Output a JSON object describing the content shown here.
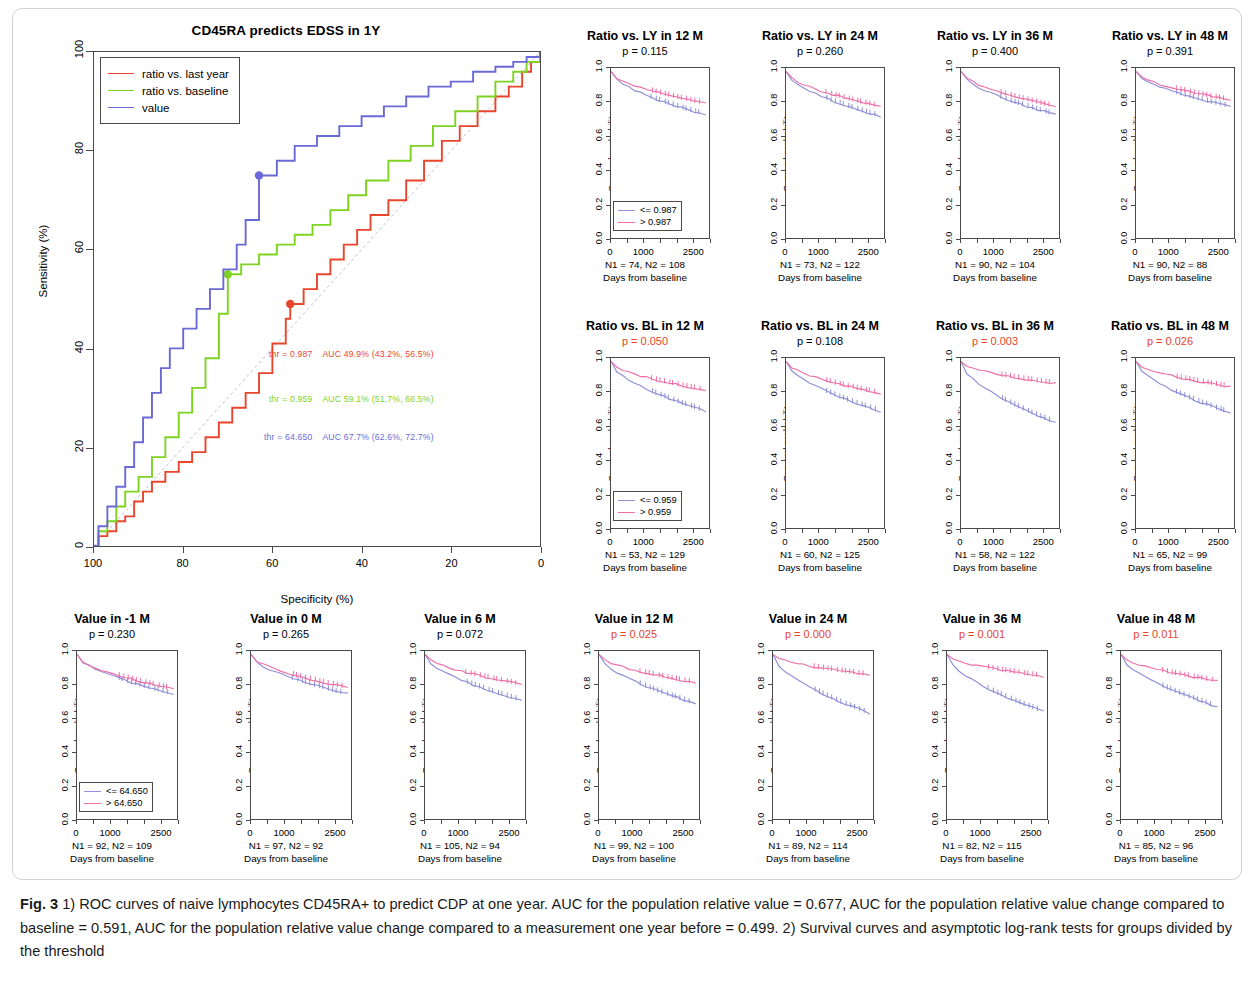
{
  "colors": {
    "red": "#e8452c",
    "green": "#7ed321",
    "blue": "#6a6ad6",
    "pink": "#ee6fa8",
    "purple": "#8f8fd8",
    "axis": "#4a4a4a",
    "sig_red": "#e8452c",
    "black": "#000000"
  },
  "roc": {
    "title": "CD45RA predicts EDSS in 1Y",
    "xlabel": "Specificity (%)",
    "ylabel": "Sensitivity (%)",
    "xticks": [
      "100",
      "80",
      "60",
      "40",
      "20",
      "0"
    ],
    "yticks": [
      "0",
      "20",
      "40",
      "60",
      "80",
      "100"
    ],
    "legend": [
      {
        "label": "ratio vs. last year",
        "color": "#e8452c"
      },
      {
        "label": "ratio vs. baseline",
        "color": "#7ed321"
      },
      {
        "label": "value",
        "color": "#6a6ad6"
      }
    ],
    "annotations": [
      {
        "threshold": "thr = 0.987",
        "auc": "AUC 49.9% (43.2%, 56.5%)",
        "color": "#e8452c"
      },
      {
        "threshold": "thr = 0.959",
        "auc": "AUC 59.1% (51.7%, 66.5%)",
        "color": "#7ed321"
      },
      {
        "threshold": "thr = 64.650",
        "auc": "AUC 67.7% (62.6%, 72.7%)",
        "color": "#6a6ad6"
      }
    ]
  },
  "chart_data": {
    "type": "line",
    "title": "CD45RA predicts EDSS in 1Y",
    "xlabel": "Specificity (%)",
    "ylabel": "Sensitivity (%)",
    "xlim": [
      100,
      0
    ],
    "ylim": [
      0,
      100
    ],
    "grid": false,
    "legend_position": "top-left",
    "reference_line": "diagonal chance line from (100,0) to (0,100)",
    "series": [
      {
        "name": "ratio vs. last year",
        "color": "#e8452c",
        "auc_percent": 49.9,
        "auc_ci": [
          43.2,
          56.5
        ],
        "threshold": 0.987,
        "operating_point": {
          "specificity": 56,
          "sensitivity": 49
        },
        "points": [
          [
            100,
            0
          ],
          [
            99,
            2
          ],
          [
            97,
            3
          ],
          [
            95,
            5
          ],
          [
            93,
            6
          ],
          [
            91,
            9
          ],
          [
            89,
            11
          ],
          [
            87,
            13
          ],
          [
            84,
            15
          ],
          [
            81,
            17
          ],
          [
            78,
            19
          ],
          [
            75,
            22
          ],
          [
            72,
            25
          ],
          [
            69,
            28
          ],
          [
            66,
            31
          ],
          [
            63,
            35
          ],
          [
            60,
            41
          ],
          [
            57,
            46
          ],
          [
            56,
            49
          ],
          [
            53,
            52
          ],
          [
            50,
            55
          ],
          [
            47,
            58
          ],
          [
            44,
            61
          ],
          [
            41,
            64
          ],
          [
            38,
            67
          ],
          [
            34,
            70
          ],
          [
            30,
            74
          ],
          [
            26,
            78
          ],
          [
            22,
            82
          ],
          [
            18,
            85
          ],
          [
            14,
            88
          ],
          [
            10,
            91
          ],
          [
            7,
            93
          ],
          [
            4,
            96
          ],
          [
            2,
            98
          ],
          [
            0,
            100
          ]
        ]
      },
      {
        "name": "ratio vs. baseline",
        "color": "#7ed321",
        "auc_percent": 59.1,
        "auc_ci": [
          51.7,
          66.5
        ],
        "threshold": 0.959,
        "operating_point": {
          "specificity": 70,
          "sensitivity": 55
        },
        "points": [
          [
            100,
            0
          ],
          [
            99,
            3
          ],
          [
            97,
            5
          ],
          [
            95,
            8
          ],
          [
            93,
            11
          ],
          [
            90,
            14
          ],
          [
            87,
            18
          ],
          [
            84,
            22
          ],
          [
            81,
            27
          ],
          [
            78,
            32
          ],
          [
            75,
            38
          ],
          [
            72,
            47
          ],
          [
            70,
            55
          ],
          [
            67,
            57
          ],
          [
            63,
            59
          ],
          [
            59,
            61
          ],
          [
            55,
            63
          ],
          [
            51,
            65
          ],
          [
            47,
            68
          ],
          [
            43,
            71
          ],
          [
            39,
            74
          ],
          [
            34,
            78
          ],
          [
            29,
            81
          ],
          [
            24,
            85
          ],
          [
            19,
            88
          ],
          [
            14,
            91
          ],
          [
            10,
            94
          ],
          [
            6,
            96
          ],
          [
            3,
            98
          ],
          [
            0,
            100
          ]
        ]
      },
      {
        "name": "value",
        "color": "#6a6ad6",
        "auc_percent": 67.7,
        "auc_ci": [
          62.6,
          72.7
        ],
        "threshold": 64.65,
        "operating_point": {
          "specificity": 63,
          "sensitivity": 75
        },
        "points": [
          [
            100,
            0
          ],
          [
            99,
            4
          ],
          [
            97,
            8
          ],
          [
            95,
            12
          ],
          [
            93,
            16
          ],
          [
            91,
            21
          ],
          [
            89,
            26
          ],
          [
            87,
            31
          ],
          [
            85,
            36
          ],
          [
            83,
            40
          ],
          [
            80,
            44
          ],
          [
            77,
            48
          ],
          [
            74,
            52
          ],
          [
            71,
            56
          ],
          [
            68,
            61
          ],
          [
            66,
            66
          ],
          [
            63,
            75
          ],
          [
            59,
            78
          ],
          [
            55,
            81
          ],
          [
            50,
            83
          ],
          [
            45,
            85
          ],
          [
            40,
            87
          ],
          [
            35,
            89
          ],
          [
            30,
            91
          ],
          [
            25,
            93
          ],
          [
            20,
            94
          ],
          [
            15,
            96
          ],
          [
            10,
            97
          ],
          [
            6,
            98
          ],
          [
            3,
            99
          ],
          [
            0,
            100
          ]
        ]
      }
    ]
  },
  "km_common": {
    "ylabel": "Survival probability",
    "xlabel": "Days from baseline",
    "yticks": [
      "0.0",
      "0.2",
      "0.4",
      "0.6",
      "0.8",
      "1.0"
    ],
    "xticks": [
      "0",
      "1000",
      "2500"
    ]
  },
  "km_panels": [
    {
      "title": "Ratio vs. LY in 12 M",
      "p": "p = 0.115",
      "p_significant": false,
      "n_text": "N1 = 74, N2 = 108",
      "n1": 74,
      "n2": 108,
      "legend": [
        {
          "label": "<= 0.987",
          "color": "#8f8fd8"
        },
        {
          "label": "> 0.987",
          "color": "#ee6fa8"
        }
      ],
      "low_end": 0.74,
      "high_end": 0.81
    },
    {
      "title": "Ratio vs. LY in 24 M",
      "p": "p = 0.260",
      "p_significant": false,
      "n_text": "N1 = 73, N2 = 122",
      "n1": 73,
      "n2": 122,
      "legend": null,
      "low_end": 0.73,
      "high_end": 0.79
    },
    {
      "title": "Ratio vs. LY in 36 M",
      "p": "p = 0.400",
      "p_significant": false,
      "n_text": "N1 = 90, N2 = 104",
      "n1": 90,
      "n2": 104,
      "legend": null,
      "low_end": 0.74,
      "high_end": 0.79
    },
    {
      "title": "Ratio vs. LY in 48 M",
      "p": "p = 0.391",
      "p_significant": false,
      "n_text": "N1 = 90, N2 = 88",
      "n1": 90,
      "n2": 88,
      "legend": null,
      "low_end": 0.79,
      "high_end": 0.83
    },
    {
      "title": "Ratio vs. BL in 12 M",
      "p": "p = 0.050",
      "p_significant": true,
      "n_text": "N1 = 53, N2 = 129",
      "n1": 53,
      "n2": 129,
      "legend": [
        {
          "label": "<= 0.959",
          "color": "#8f8fd8"
        },
        {
          "label": "> 0.959",
          "color": "#ee6fa8"
        }
      ],
      "low_end": 0.7,
      "high_end": 0.83
    },
    {
      "title": "Ratio vs. BL in 24 M",
      "p": "p = 0.108",
      "p_significant": false,
      "n_text": "N1 = 60, N2 = 125",
      "n1": 60,
      "n2": 125,
      "legend": null,
      "low_end": 0.7,
      "high_end": 0.81
    },
    {
      "title": "Ratio vs. BL in 36 M",
      "p": "p = 0.003",
      "p_significant": true,
      "n_text": "N1 = 58, N2 = 122",
      "n1": 58,
      "n2": 122,
      "legend": null,
      "low_end": 0.63,
      "high_end": 0.87
    },
    {
      "title": "Ratio vs. BL in 48 M",
      "p": "p = 0.026",
      "p_significant": true,
      "n_text": "N1 = 65, N2 = 99",
      "n1": 65,
      "n2": 99,
      "legend": null,
      "low_end": 0.69,
      "high_end": 0.85
    },
    {
      "title": "Value in -1 M",
      "p": "p = 0.230",
      "p_significant": false,
      "n_text": "N1 = 92, N2 = 109",
      "n1": 92,
      "n2": 109,
      "legend": [
        {
          "label": "<= 64.650",
          "color": "#8f8fd8"
        },
        {
          "label": "> 64.650",
          "color": "#ee6fa8"
        }
      ],
      "low_end": 0.76,
      "high_end": 0.79
    },
    {
      "title": "Value in 0 M",
      "p": "p = 0.265",
      "p_significant": false,
      "n_text": "N1 = 97, N2 = 92",
      "n1": 97,
      "n2": 92,
      "legend": null,
      "low_end": 0.76,
      "high_end": 0.8
    },
    {
      "title": "Value in 6 M",
      "p": "p = 0.072",
      "p_significant": false,
      "n_text": "N1 = 105, N2 = 94",
      "n1": 105,
      "n2": 94,
      "legend": null,
      "low_end": 0.72,
      "high_end": 0.82
    },
    {
      "title": "Value in 12 M",
      "p": "p = 0.025",
      "p_significant": true,
      "n_text": "N1 = 99, N2 = 100",
      "n1": 99,
      "n2": 100,
      "legend": null,
      "low_end": 0.7,
      "high_end": 0.83
    },
    {
      "title": "Value in 24 M",
      "p": "p = 0.000",
      "p_significant": true,
      "n_text": "N1 = 89, N2 = 114",
      "n1": 89,
      "n2": 114,
      "legend": null,
      "low_end": 0.64,
      "high_end": 0.88
    },
    {
      "title": "Value in 36 M",
      "p": "p = 0.001",
      "p_significant": true,
      "n_text": "N1 = 82, N2 = 115",
      "n1": 82,
      "n2": 115,
      "legend": null,
      "low_end": 0.65,
      "high_end": 0.87
    },
    {
      "title": "Value in 48 M",
      "p": "p = 0.011",
      "p_significant": true,
      "n_text": "N1 = 85, N2 = 96",
      "n1": 85,
      "n2": 96,
      "legend": null,
      "low_end": 0.68,
      "high_end": 0.84
    }
  ],
  "caption": {
    "label": "Fig. 3",
    "text": " 1) ROC curves of naive lymphocytes CD45RA+ to predict CDP at one year. AUC for the population relative value = 0.677, AUC for the population relative value change compared to baseline = 0.591, AUC for the population relative value change compared to a measurement one year before = 0.499. 2) Survival curves and asymptotic log-rank tests for groups divided by the threshold"
  }
}
